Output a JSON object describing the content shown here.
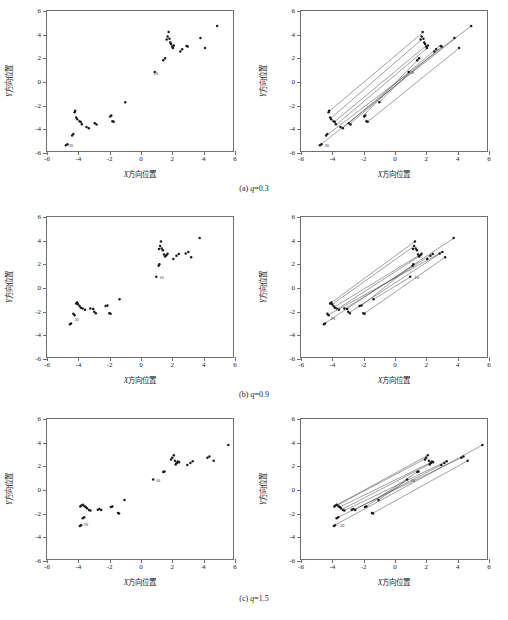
{
  "figure": {
    "axis_x_label_prefix": "X",
    "axis_x_label_text": "方向位置",
    "axis_y_label_prefix": "Y",
    "axis_y_label_text": "方向位置",
    "x_ticks": [
      "-6",
      "-4",
      "-2",
      "0",
      "2",
      "4",
      "6"
    ],
    "y_ticks": [
      "6",
      "4",
      "2",
      "0",
      "-2",
      "-4",
      "-6"
    ],
    "xlim": [
      -6,
      6
    ],
    "ylim": [
      -6,
      6
    ],
    "colors": {
      "axis": "#6e6e6e",
      "marker": "#1a1a1a",
      "line": "#3d3d3d",
      "text": "#1a1a1a",
      "background": "#ffffff"
    },
    "captions": [
      {
        "index": "(a)",
        "param": "q",
        "value": "0.3",
        "full": "(a) q=0.3"
      },
      {
        "index": "(b)",
        "param": "q",
        "value": "0.9",
        "full": "(b) q=0.9"
      },
      {
        "index": "(c)",
        "param": "q",
        "value": "1.5",
        "full": "(c) q=1.5"
      }
    ]
  },
  "chart_data": [
    {
      "id": "a-left",
      "type": "scatter",
      "title": "",
      "xlabel": "X方向位置",
      "ylabel": "Y方向位置",
      "xlim": [
        -6,
        6
      ],
      "ylim": [
        -6,
        6
      ],
      "grid": false,
      "legend": false,
      "xticks": [
        -6,
        -4,
        -2,
        0,
        2,
        4,
        6
      ],
      "yticks": [
        -6,
        -4,
        -2,
        0,
        2,
        4,
        6
      ],
      "annotations": [
        {
          "text": "10",
          "x": 0.75,
          "y": 0.72
        },
        {
          "text": "20",
          "x": -4.72,
          "y": -5.48
        }
      ],
      "points": [
        [
          0.95,
          0.78
        ],
        [
          1.5,
          1.78
        ],
        [
          1.62,
          1.95
        ],
        [
          1.72,
          3.55
        ],
        [
          1.78,
          3.82
        ],
        [
          1.85,
          4.2
        ],
        [
          1.9,
          3.62
        ],
        [
          1.95,
          3.3
        ],
        [
          2.0,
          3.18
        ],
        [
          2.08,
          2.95
        ],
        [
          2.12,
          2.82
        ],
        [
          2.18,
          3.05
        ],
        [
          2.6,
          2.52
        ],
        [
          2.72,
          2.72
        ],
        [
          3.0,
          3.0
        ],
        [
          3.08,
          2.95
        ],
        [
          3.9,
          3.68
        ],
        [
          4.2,
          2.82
        ],
        [
          4.98,
          4.72
        ],
        [
          -0.95,
          -1.82
        ],
        [
          -1.7,
          -3.5
        ],
        [
          -1.78,
          -3.45
        ],
        [
          -1.85,
          -2.95
        ],
        [
          -1.92,
          -3.05
        ],
        [
          -2.8,
          -3.72
        ],
        [
          -2.92,
          -3.62
        ],
        [
          -3.3,
          -4.05
        ],
        [
          -3.45,
          -3.95
        ],
        [
          -3.75,
          -3.7
        ],
        [
          -3.82,
          -3.52
        ],
        [
          -3.9,
          -3.45
        ],
        [
          -4.05,
          -3.28
        ],
        [
          -4.12,
          -3.12
        ],
        [
          -4.18,
          -2.55
        ],
        [
          -4.22,
          -2.68
        ],
        [
          -4.3,
          -4.55
        ],
        [
          -4.38,
          -4.68
        ],
        [
          -4.68,
          -5.42
        ],
        [
          -4.78,
          -5.5
        ]
      ]
    },
    {
      "id": "a-right",
      "type": "scatter",
      "note": "same points as a-left with connector lines joining matched pairs",
      "xlabel": "X方向位置",
      "ylabel": "Y方向位置",
      "xlim": [
        -6,
        6
      ],
      "ylim": [
        -6,
        6
      ],
      "grid": false,
      "legend": false,
      "annotations": [
        {
          "text": "10",
          "x": 0.9,
          "y": 0.75
        },
        {
          "text": "20",
          "x": -4.6,
          "y": -5.45
        }
      ],
      "connections": [
        [
          [
            -4.72,
            -5.45
          ],
          [
            4.95,
            4.7
          ]
        ],
        [
          [
            -4.3,
            -4.6
          ],
          [
            3.95,
            3.7
          ]
        ],
        [
          [
            -4.18,
            -2.6
          ],
          [
            1.85,
            4.15
          ]
        ],
        [
          [
            -4.08,
            -3.2
          ],
          [
            1.78,
            3.55
          ]
        ],
        [
          [
            -3.85,
            -3.5
          ],
          [
            2.05,
            3.0
          ]
        ],
        [
          [
            -3.7,
            -3.72
          ],
          [
            2.1,
            2.78
          ]
        ],
        [
          [
            -3.32,
            -4.05
          ],
          [
            2.9,
            2.95
          ]
        ],
        [
          [
            -2.85,
            -3.68
          ],
          [
            3.05,
            2.9
          ]
        ],
        [
          [
            -2.0,
            -3.0
          ],
          [
            1.6,
            1.9
          ]
        ],
        [
          [
            -1.72,
            -3.52
          ],
          [
            4.18,
            2.8
          ]
        ],
        [
          [
            -0.95,
            -1.82
          ],
          [
            1.0,
            0.75
          ]
        ]
      ]
    },
    {
      "id": "b-left",
      "type": "scatter",
      "xlabel": "X方向位置",
      "ylabel": "Y方向位置",
      "xlim": [
        -6,
        6
      ],
      "ylim": [
        -6,
        6
      ],
      "grid": false,
      "legend": false,
      "annotations": [
        {
          "text": "10",
          "x": 1.12,
          "y": 0.82
        },
        {
          "text": "20",
          "x": -4.35,
          "y": -2.78
        }
      ],
      "points": [
        [
          1.05,
          0.88
        ],
        [
          1.2,
          1.82
        ],
        [
          1.25,
          1.95
        ],
        [
          1.22,
          3.25
        ],
        [
          1.3,
          3.52
        ],
        [
          1.35,
          3.9
        ],
        [
          1.4,
          3.3
        ],
        [
          1.48,
          3.15
        ],
        [
          1.55,
          2.78
        ],
        [
          1.62,
          2.62
        ],
        [
          1.7,
          2.72
        ],
        [
          1.78,
          2.85
        ],
        [
          2.15,
          2.4
        ],
        [
          2.35,
          2.68
        ],
        [
          2.5,
          2.82
        ],
        [
          2.95,
          2.88
        ],
        [
          3.12,
          3.0
        ],
        [
          3.3,
          2.55
        ],
        [
          3.85,
          4.2
        ],
        [
          -1.32,
          -1.05
        ],
        [
          -1.9,
          -2.3
        ],
        [
          -1.98,
          -2.25
        ],
        [
          -2.1,
          -1.58
        ],
        [
          -2.22,
          -1.62
        ],
        [
          -2.85,
          -2.25
        ],
        [
          -2.95,
          -2.12
        ],
        [
          -3.02,
          -1.88
        ],
        [
          -3.2,
          -1.85
        ],
        [
          -3.55,
          -1.95
        ],
        [
          -3.7,
          -1.85
        ],
        [
          -3.82,
          -1.78
        ],
        [
          -3.9,
          -1.62
        ],
        [
          -4.0,
          -1.48
        ],
        [
          -4.05,
          -1.32
        ],
        [
          -4.12,
          -1.42
        ],
        [
          -4.22,
          -2.42
        ],
        [
          -4.3,
          -2.3
        ],
        [
          -4.45,
          -3.12
        ],
        [
          -4.52,
          -3.2
        ]
      ]
    },
    {
      "id": "b-right",
      "type": "scatter",
      "note": "same points as b-left with connector lines joining matched pairs",
      "xlabel": "X方向位置",
      "ylabel": "Y方向位置",
      "xlim": [
        -6,
        6
      ],
      "ylim": [
        -6,
        6
      ],
      "grid": false,
      "legend": false,
      "annotations": [
        {
          "text": "10",
          "x": 1.2,
          "y": 0.85
        },
        {
          "text": "20",
          "x": -4.2,
          "y": -2.7
        }
      ],
      "connections": [
        [
          [
            -4.5,
            -3.15
          ],
          [
            3.85,
            4.18
          ]
        ],
        [
          [
            -4.22,
            -2.38
          ],
          [
            3.1,
            3.0
          ]
        ],
        [
          [
            -4.1,
            -1.4
          ],
          [
            1.32,
            3.88
          ]
        ],
        [
          [
            -4.0,
            -1.5
          ],
          [
            1.3,
            3.5
          ]
        ],
        [
          [
            -3.85,
            -1.72
          ],
          [
            1.72,
            2.8
          ]
        ],
        [
          [
            -3.65,
            -1.88
          ],
          [
            1.62,
            2.62
          ]
        ],
        [
          [
            -3.2,
            -1.88
          ],
          [
            2.42,
            2.75
          ]
        ],
        [
          [
            -2.88,
            -2.2
          ],
          [
            2.95,
            2.85
          ]
        ],
        [
          [
            -2.1,
            -1.6
          ],
          [
            1.22,
            1.9
          ]
        ],
        [
          [
            -1.92,
            -2.28
          ],
          [
            3.3,
            2.55
          ]
        ],
        [
          [
            -1.32,
            -1.05
          ],
          [
            1.05,
            0.85
          ]
        ]
      ]
    },
    {
      "id": "c-left",
      "type": "scatter",
      "xlabel": "X方向位置",
      "ylabel": "Y方向位置",
      "xlim": [
        -6,
        6
      ],
      "ylim": [
        -6,
        6
      ],
      "grid": false,
      "legend": false,
      "annotations": [
        {
          "text": "10",
          "x": 0.9,
          "y": 0.78
        },
        {
          "text": "20",
          "x": -3.75,
          "y": -2.98
        }
      ],
      "points": [
        [
          0.85,
          0.82
        ],
        [
          1.5,
          1.45
        ],
        [
          1.58,
          1.5
        ],
        [
          2.0,
          2.52
        ],
        [
          2.08,
          2.68
        ],
        [
          2.18,
          2.9
        ],
        [
          2.25,
          2.42
        ],
        [
          2.3,
          2.1
        ],
        [
          2.35,
          2.2
        ],
        [
          2.4,
          2.28
        ],
        [
          2.45,
          2.35
        ],
        [
          2.52,
          2.3
        ],
        [
          3.05,
          2.05
        ],
        [
          3.25,
          2.22
        ],
        [
          3.4,
          2.38
        ],
        [
          4.35,
          2.68
        ],
        [
          4.48,
          2.78
        ],
        [
          4.75,
          2.42
        ],
        [
          5.7,
          3.78
        ],
        [
          -1.0,
          -0.95
        ],
        [
          -1.35,
          -2.1
        ],
        [
          -1.42,
          -2.05
        ],
        [
          -1.78,
          -1.5
        ],
        [
          -1.88,
          -1.55
        ],
        [
          -2.5,
          -1.8
        ],
        [
          -2.62,
          -1.72
        ],
        [
          -2.72,
          -1.78
        ],
        [
          -3.2,
          -1.85
        ],
        [
          -3.3,
          -1.8
        ],
        [
          -3.42,
          -1.65
        ],
        [
          -3.5,
          -1.55
        ],
        [
          -3.58,
          -1.48
        ],
        [
          -3.68,
          -1.35
        ],
        [
          -3.78,
          -1.42
        ],
        [
          -3.85,
          -1.5
        ],
        [
          -3.6,
          -2.42
        ],
        [
          -3.7,
          -2.5
        ],
        [
          -3.8,
          -3.1
        ],
        [
          -3.88,
          -3.18
        ]
      ]
    },
    {
      "id": "c-right",
      "type": "scatter",
      "note": "same points as c-left with connector lines joining matched pairs",
      "xlabel": "X方向位置",
      "ylabel": "Y方向位置",
      "xlim": [
        -6,
        6
      ],
      "ylim": [
        -6,
        6
      ],
      "grid": false,
      "legend": false,
      "annotations": [
        {
          "text": "10",
          "x": 0.95,
          "y": 0.8
        },
        {
          "text": "20",
          "x": -3.6,
          "y": -3.05
        }
      ],
      "connections": [
        [
          [
            -3.85,
            -3.12
          ],
          [
            5.68,
            3.75
          ]
        ],
        [
          [
            -3.65,
            -2.45
          ],
          [
            4.45,
            2.75
          ]
        ],
        [
          [
            -3.8,
            -1.45
          ],
          [
            2.18,
            2.88
          ]
        ],
        [
          [
            -3.65,
            -1.38
          ],
          [
            2.1,
            2.65
          ]
        ],
        [
          [
            -3.5,
            -1.55
          ],
          [
            2.45,
            2.32
          ]
        ],
        [
          [
            -3.35,
            -1.75
          ],
          [
            2.38,
            2.2
          ]
        ],
        [
          [
            -3.2,
            -1.85
          ],
          [
            3.35,
            2.35
          ]
        ],
        [
          [
            -2.55,
            -1.78
          ],
          [
            3.25,
            2.2
          ]
        ],
        [
          [
            -1.8,
            -1.5
          ],
          [
            1.52,
            1.48
          ]
        ],
        [
          [
            -1.38,
            -2.08
          ],
          [
            4.75,
            2.42
          ]
        ],
        [
          [
            -1.0,
            -0.95
          ],
          [
            0.88,
            0.8
          ]
        ]
      ]
    }
  ]
}
